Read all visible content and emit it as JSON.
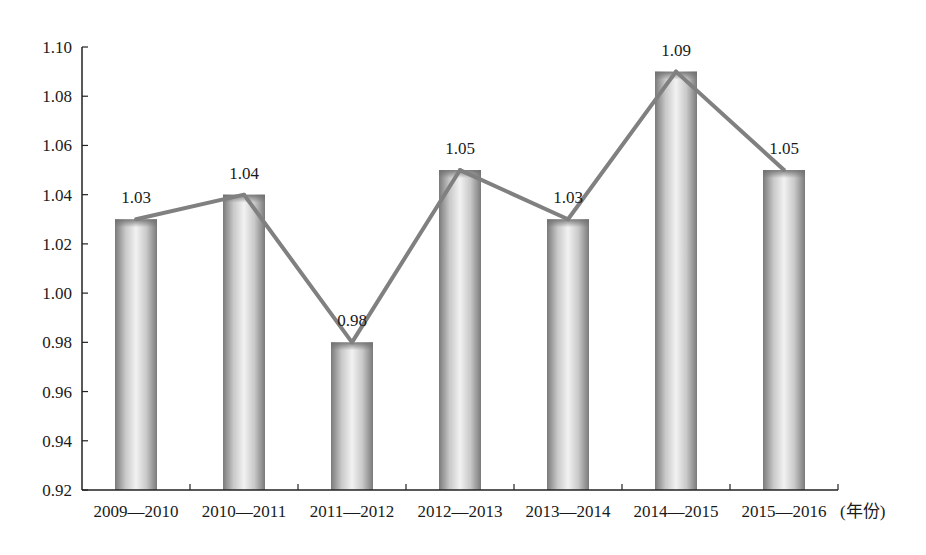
{
  "chart_data": {
    "type": "bar",
    "title": "",
    "xlabel": "(年份)",
    "ylabel": "",
    "categories": [
      "2009—2010",
      "2010—2011",
      "2011—2012",
      "2012—2013",
      "2013—2014",
      "2014—2015",
      "2015—2016"
    ],
    "series": [
      {
        "name": "bar",
        "type": "bar",
        "values": [
          1.03,
          1.04,
          0.98,
          1.05,
          1.03,
          1.09,
          1.05
        ]
      },
      {
        "name": "line",
        "type": "line",
        "values": [
          1.03,
          1.04,
          0.98,
          1.05,
          1.03,
          1.09,
          1.05
        ]
      }
    ],
    "data_labels": [
      "1.03",
      "1.04",
      "0.98",
      "1.05",
      "1.03",
      "1.09",
      "1.05"
    ],
    "ylim": [
      0.92,
      1.1
    ],
    "yticks": [
      "0.92",
      "0.94",
      "0.96",
      "0.98",
      "1.00",
      "1.02",
      "1.04",
      "1.06",
      "1.08",
      "1.10"
    ],
    "grid": false,
    "legend": "none",
    "colors": {
      "line": "#808080",
      "bar_edge": "#7a7a7a",
      "bar_center": "#f2f2f2",
      "axis": "#222222"
    }
  }
}
